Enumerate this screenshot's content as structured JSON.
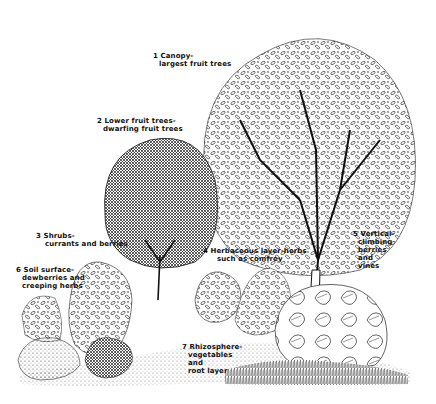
{
  "colors": {
    "ink": "#111111",
    "paper": "#ffffff"
  },
  "layers": [
    {
      "num": "1",
      "line1": "1 Canopy-",
      "line2": "largest fruit trees",
      "line3": ""
    },
    {
      "num": "2",
      "line1": "2 Lower fruit trees-",
      "line2": "dwarfing fruit trees",
      "line3": ""
    },
    {
      "num": "3",
      "line1": "3 Shrubs-",
      "line2": "currants and berries",
      "line3": ""
    },
    {
      "num": "4",
      "line1": "4 Herbaceous layer-herbs",
      "line2": "such as comfrey",
      "line3": ""
    },
    {
      "num": "5",
      "line1": "5 Vertical-",
      "line2": "climbing",
      "line3": "berries",
      "line4": "and",
      "line5": "vines"
    },
    {
      "num": "6",
      "line1": "6 Soil surface-",
      "line2": "dewberries and",
      "line3": "creeping herbs"
    },
    {
      "num": "7",
      "line1": "7 Rhizosphere-",
      "line2": "vegetables",
      "line3": "and",
      "line4": "root layer"
    }
  ]
}
